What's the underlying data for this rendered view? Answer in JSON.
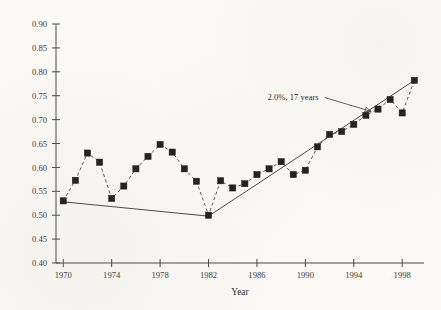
{
  "chart_data": {
    "type": "scatter",
    "title": "",
    "subtitle": "",
    "xlabel": "Year",
    "ylabel": "",
    "xlim": [
      1969.4,
      1999.8
    ],
    "ylim": [
      0.4,
      0.9
    ],
    "grid": false,
    "legend": null,
    "x_ticks": [
      1970,
      1974,
      1978,
      1982,
      1986,
      1990,
      1994,
      1998
    ],
    "x_tick_labels": [
      "1970",
      "1974",
      "1978",
      "1982",
      "1986",
      "1990",
      "1994",
      "1998"
    ],
    "y_ticks": [
      0.4,
      0.45,
      0.5,
      0.55,
      0.6,
      0.65,
      0.7,
      0.75,
      0.8,
      0.85,
      0.9
    ],
    "y_tick_labels": [
      "0.40",
      "0.45",
      "0.50",
      "0.55",
      "0.60",
      "0.65",
      "0.70",
      "0.75",
      "0.80",
      "0.85",
      "0.90"
    ],
    "series": [
      {
        "name": "observed",
        "marker": "filled-square",
        "connector": "dashed",
        "x": [
          1970,
          1971,
          1972,
          1973,
          1974,
          1975,
          1976,
          1977,
          1978,
          1979,
          1980,
          1981,
          1982,
          1983,
          1984,
          1985,
          1986,
          1987,
          1988,
          1989,
          1990,
          1991,
          1992,
          1993,
          1994,
          1995,
          1996,
          1997,
          1998,
          1999
        ],
        "values": [
          0.53,
          0.573,
          0.63,
          0.611,
          0.535,
          0.561,
          0.597,
          0.623,
          0.648,
          0.632,
          0.597,
          0.571,
          0.5,
          0.572,
          0.557,
          0.566,
          0.585,
          0.597,
          0.612,
          0.585,
          0.594,
          0.643,
          0.669,
          0.675,
          0.69,
          0.709,
          0.722,
          0.742,
          0.714,
          0.782
        ]
      }
    ],
    "trend_lines": [
      {
        "name": "declining-segment",
        "x": [
          1970,
          1982
        ],
        "values": [
          0.528,
          0.498
        ]
      },
      {
        "name": "rising-segment",
        "x": [
          1982,
          1999
        ],
        "values": [
          0.498,
          0.782
        ]
      }
    ],
    "annotations": [
      {
        "name": "growth-rate-callout",
        "text": "2.0%, 17 years",
        "x": 1991.1,
        "y": 0.742,
        "arrow_to_x": 1995.6,
        "arrow_to_y": 0.713
      }
    ]
  }
}
